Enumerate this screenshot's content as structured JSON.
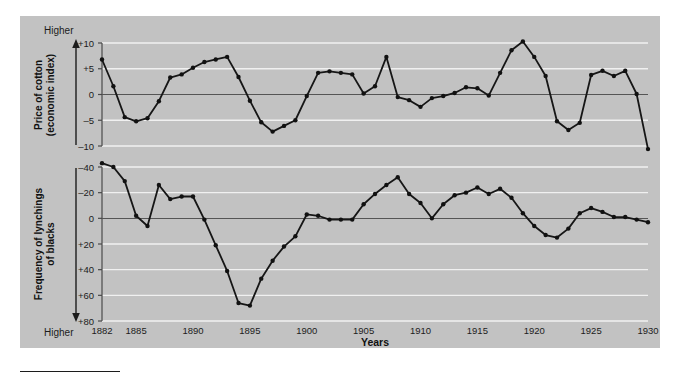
{
  "figure": {
    "background_color": "#c2c2c2",
    "line_color": "#161616",
    "gridline_color": "#f0f0f0",
    "zeroline_color": "#555555"
  },
  "x_axis": {
    "title": "Years",
    "tick_labels": [
      "1882",
      "1885",
      "1890",
      "1895",
      "1900",
      "1905",
      "1910",
      "1915",
      "1920",
      "1925",
      "1930"
    ],
    "tick_years": [
      1882,
      1885,
      1890,
      1895,
      1900,
      1905,
      1910,
      1915,
      1920,
      1925,
      1930
    ],
    "range": [
      1882,
      1930
    ]
  },
  "top_panel": {
    "axis_title_line1": "Price of cotton",
    "axis_title_line2": "(economic index)",
    "direction_label": "Higher",
    "tick_labels": [
      "+10",
      "+5",
      "0",
      "–5",
      "–10"
    ],
    "tick_values": [
      10,
      5,
      0,
      -5,
      -10
    ]
  },
  "bottom_panel": {
    "axis_title_line1": "Frequency of lynchings",
    "axis_title_line2": "of blacks",
    "direction_label": "Higher",
    "tick_labels": [
      "–40",
      "–20",
      "0",
      "+20",
      "+40",
      "+60",
      "+80"
    ],
    "tick_values": [
      -40,
      -20,
      0,
      20,
      40,
      60,
      80
    ]
  },
  "chart_data": {
    "type": "line",
    "title": "",
    "xlabel": "Years",
    "grid": true,
    "legend": "none",
    "x": [
      1882,
      1883,
      1884,
      1885,
      1886,
      1887,
      1888,
      1889,
      1890,
      1891,
      1892,
      1893,
      1894,
      1895,
      1896,
      1897,
      1898,
      1899,
      1900,
      1901,
      1902,
      1903,
      1904,
      1905,
      1906,
      1907,
      1908,
      1909,
      1910,
      1911,
      1912,
      1913,
      1914,
      1915,
      1916,
      1917,
      1918,
      1919,
      1920,
      1921,
      1922,
      1923,
      1924,
      1925,
      1926,
      1927,
      1928,
      1929,
      1930
    ],
    "series": [
      {
        "name": "Price of cotton (economic index)",
        "ylabel": "Price of cotton (economic index)",
        "ylim": [
          -10,
          10
        ],
        "y_inverted": false,
        "values": [
          6.8,
          1.6,
          -4.4,
          -5.2,
          -4.6,
          -1.3,
          3.3,
          3.9,
          5.2,
          6.3,
          6.8,
          7.3,
          3.4,
          -1.2,
          -5.4,
          -7.2,
          -6.1,
          -5.0,
          -0.3,
          4.2,
          4.5,
          4.2,
          3.9,
          0.2,
          1.6,
          7.3,
          -0.5,
          -1.1,
          -2.4,
          -0.7,
          -0.3,
          0.3,
          1.4,
          1.2,
          -0.2,
          4.2,
          8.6,
          10.3,
          7.3,
          3.6,
          -5.2,
          -6.9,
          -5.5,
          3.8,
          4.6,
          3.6,
          4.6,
          0.1,
          -10.6
        ]
      },
      {
        "name": "Frequency of lynchings of blacks",
        "ylabel": "Frequency of lynchings of blacks",
        "ylim": [
          -40,
          80
        ],
        "y_inverted": true,
        "values": [
          -43,
          -40,
          -29,
          -2,
          6,
          -26,
          -15,
          -17,
          -17,
          1,
          21,
          41,
          66,
          68,
          47,
          33,
          22,
          14,
          -3,
          -2,
          1,
          1,
          1,
          -11,
          -19,
          -26,
          -32,
          -19,
          -12,
          0,
          -11,
          -18,
          -20,
          -24,
          -19,
          -23,
          -16,
          -4,
          6,
          13,
          15,
          8,
          -4,
          -8,
          -5,
          -1,
          -1,
          1,
          3
        ]
      }
    ]
  }
}
